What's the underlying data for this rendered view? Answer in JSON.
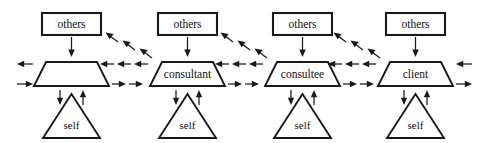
{
  "diagram": {
    "background_color": "#ffffff",
    "stroke_color": "#1a1a1a",
    "columns": [
      {
        "id": "column-1",
        "top_label": "others",
        "middle_label": "",
        "bottom_label": "self"
      },
      {
        "id": "column-2",
        "top_label": "others",
        "middle_label": "consultant",
        "bottom_label": "self"
      },
      {
        "id": "column-3",
        "top_label": "others",
        "middle_label": "consultee",
        "bottom_label": "self"
      },
      {
        "id": "column-4",
        "top_label": "others",
        "middle_label": "client",
        "bottom_label": "self"
      }
    ],
    "arrow_groups": {
      "others_to_middle": "down-arrow",
      "middle_to_self": "down-arrow",
      "self_to_middle": "up-arrow",
      "between_columns_upper": "left-arrows",
      "between_columns_lower": "right-arrows",
      "diagonal_to_others": "up-left-arrows",
      "edge_left_upper": "left-arrow",
      "edge_left_lower": "right-arrow",
      "edge_right_upper": "left-arrow",
      "edge_right_lower": "right-arrow"
    }
  }
}
